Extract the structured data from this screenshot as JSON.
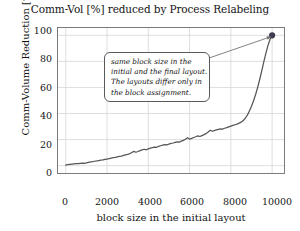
{
  "chart_data": {
    "type": "line",
    "title": "Comm-Vol [%] reduced by Process Relabeling",
    "xlabel": "block size in the initial layout",
    "ylabel": "Comm-Volume Reduction [%]",
    "xlim": [
      -400,
      10600
    ],
    "ylim": [
      -6,
      106
    ],
    "xticks": [
      0,
      2000,
      4000,
      6000,
      8000,
      10000
    ],
    "yticks": [
      0,
      20,
      40,
      60,
      80,
      100
    ],
    "grid": true,
    "legend": null,
    "line_color": "#555555",
    "marker": {
      "x": 10000,
      "y": 100,
      "color": "#3d3d4f",
      "shape": "circle"
    },
    "annotation": {
      "lines": [
        "same block size in the",
        "initial and the final layout.",
        "The layouts differ only in",
        "the block assignment."
      ],
      "arrow_from": [
        6100,
        78
      ],
      "arrow_to": [
        9950,
        99
      ]
    },
    "x": [
      0,
      100,
      200,
      300,
      400,
      500,
      600,
      700,
      800,
      900,
      1000,
      1100,
      1200,
      1300,
      1400,
      1500,
      1600,
      1700,
      1800,
      1900,
      2000,
      2100,
      2200,
      2300,
      2400,
      2500,
      2600,
      2700,
      2800,
      2900,
      3000,
      3100,
      3200,
      3300,
      3400,
      3500,
      3600,
      3700,
      3800,
      3900,
      4000,
      4100,
      4200,
      4300,
      4400,
      4500,
      4600,
      4700,
      4800,
      4900,
      5000,
      5100,
      5200,
      5300,
      5400,
      5500,
      5600,
      5700,
      5800,
      5900,
      6000,
      6100,
      6200,
      6300,
      6400,
      6500,
      6600,
      6700,
      6800,
      6900,
      7000,
      7100,
      7200,
      7300,
      7400,
      7500,
      7600,
      7700,
      7800,
      7900,
      8000,
      8100,
      8200,
      8300,
      8400,
      8500,
      8600,
      8700,
      8800,
      8900,
      9000,
      9100,
      9200,
      9300,
      9400,
      9500,
      9600,
      9700,
      9800,
      9900,
      10000
    ],
    "y": [
      0.5,
      0.8,
      1.0,
      1.2,
      1.4,
      1.6,
      1.5,
      1.8,
      2.0,
      1.7,
      2.1,
      2.6,
      2.9,
      3.1,
      3.4,
      3.6,
      3.9,
      4.2,
      4.4,
      4.8,
      5.1,
      5.4,
      5.8,
      6.1,
      6.3,
      6.8,
      7.1,
      7.4,
      7.9,
      8.3,
      8.6,
      9.2,
      10.1,
      11.0,
      10.3,
      10.9,
      11.6,
      12.1,
      12.6,
      12.2,
      12.9,
      13.4,
      13.9,
      14.3,
      14.1,
      14.8,
      15.3,
      15.8,
      16.2,
      16.0,
      16.6,
      17.1,
      17.4,
      17.9,
      18.3,
      18.1,
      18.8,
      19.4,
      20.3,
      21.4,
      20.4,
      20.9,
      21.6,
      22.2,
      22.9,
      22.4,
      23.1,
      23.8,
      24.6,
      25.9,
      27.2,
      26.4,
      26.9,
      27.4,
      27.9,
      28.3,
      28.1,
      28.7,
      29.2,
      29.8,
      30.4,
      30.9,
      31.4,
      31.9,
      32.6,
      33.4,
      34.6,
      36.4,
      38.8,
      41.9,
      45.6,
      49.8,
      54.6,
      60.1,
      66.3,
      72.9,
      79.8,
      86.4,
      92.3,
      97.0,
      100.0
    ]
  }
}
